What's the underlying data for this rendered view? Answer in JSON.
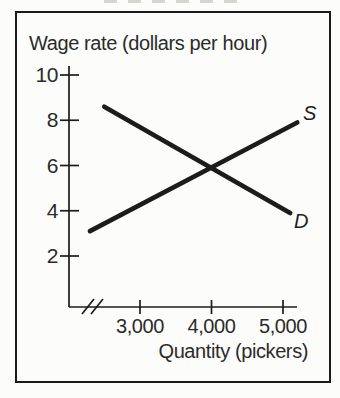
{
  "figure": {
    "y_axis_title": "Wage rate (dollars per hour)",
    "x_axis_title": "Quantity (pickers)",
    "supply_curve_label": "S",
    "demand_curve_label": "D"
  },
  "chart_data": {
    "type": "line",
    "title": "",
    "ylabel": "Wage rate (dollars per hour)",
    "xlabel": "Quantity (pickers)",
    "ylim": [
      0,
      10.5
    ],
    "xlim": [
      2100,
      5400
    ],
    "grid": false,
    "legend": "inline-end-of-line-labels",
    "x_axis_break_near_origin": true,
    "y_ticks": [
      {
        "value": 10,
        "label": "10"
      },
      {
        "value": 8,
        "label": "8"
      },
      {
        "value": 6,
        "label": "6"
      },
      {
        "value": 4,
        "label": "4"
      },
      {
        "value": 2,
        "label": "2"
      }
    ],
    "x_ticks": [
      {
        "value": 3000,
        "label": "3,000"
      },
      {
        "value": 4000,
        "label": "4,000"
      },
      {
        "value": 5000,
        "label": "5,000"
      }
    ],
    "series": [
      {
        "name": "supply",
        "label": "S",
        "points": [
          [
            2300,
            3.1
          ],
          [
            5200,
            7.9
          ]
        ]
      },
      {
        "name": "demand",
        "label": "D",
        "points": [
          [
            2500,
            8.6
          ],
          [
            5100,
            3.9
          ]
        ]
      }
    ],
    "equilibrium": {
      "quantity": 4000,
      "wage": 6
    },
    "ink_color": "#1c1c1c"
  }
}
